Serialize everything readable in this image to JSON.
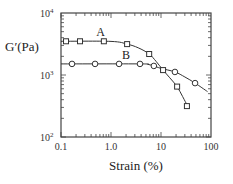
{
  "chart_data": {
    "type": "line",
    "title": "",
    "xlabel": "Strain (%)",
    "ylabel": "G′(Pa)",
    "xscale": "log",
    "yscale": "log",
    "xlim": [
      0.1,
      100
    ],
    "ylim": [
      100,
      10000
    ],
    "x_ticks": [
      {
        "value": 0.1,
        "label": "0.1"
      },
      {
        "value": 1,
        "label": "1.0"
      },
      {
        "value": 10,
        "label": "10"
      },
      {
        "value": 100,
        "label": "100"
      }
    ],
    "y_ticks": [
      {
        "value": 100,
        "label": "10",
        "exp": "2"
      },
      {
        "value": 1000,
        "label": "10",
        "exp": "3"
      },
      {
        "value": 10000,
        "label": "10",
        "exp": "4"
      }
    ],
    "grid": false,
    "legend": "none (inline series labels)",
    "series": [
      {
        "name": "A",
        "marker": "square",
        "label_pos": {
          "x": 0.62,
          "y": 4200
        },
        "points": [
          {
            "x": 0.126,
            "y": 3500
          },
          {
            "x": 0.24,
            "y": 3500
          },
          {
            "x": 0.72,
            "y": 3500
          },
          {
            "x": 2.1,
            "y": 3150
          },
          {
            "x": 5.8,
            "y": 2180
          },
          {
            "x": 11,
            "y": 1200
          },
          {
            "x": 21,
            "y": 650
          },
          {
            "x": 33,
            "y": 315
          }
        ],
        "curve": [
          [
            0.1,
            3500
          ],
          [
            1.0,
            3480
          ],
          [
            2.1,
            3150
          ],
          [
            3.5,
            2750
          ],
          [
            5.8,
            2180
          ],
          [
            8.0,
            1650
          ],
          [
            11,
            1200
          ],
          [
            15,
            900
          ],
          [
            21,
            650
          ],
          [
            27,
            450
          ],
          [
            36,
            290
          ]
        ]
      },
      {
        "name": "B",
        "marker": "circle",
        "label_pos": {
          "x": 2.0,
          "y": 1780
        },
        "points": [
          {
            "x": 0.166,
            "y": 1510
          },
          {
            "x": 0.48,
            "y": 1510
          },
          {
            "x": 1.45,
            "y": 1510
          },
          {
            "x": 3.8,
            "y": 1510
          },
          {
            "x": 7.2,
            "y": 1400
          },
          {
            "x": 19,
            "y": 1120
          },
          {
            "x": 48,
            "y": 740
          }
        ],
        "curve": [
          [
            0.1,
            1510
          ],
          [
            3.8,
            1510
          ],
          [
            5.5,
            1480
          ],
          [
            7.2,
            1400
          ],
          [
            10,
            1280
          ],
          [
            19,
            1120
          ],
          [
            30,
            930
          ],
          [
            48,
            740
          ],
          [
            85,
            540
          ]
        ]
      }
    ]
  }
}
